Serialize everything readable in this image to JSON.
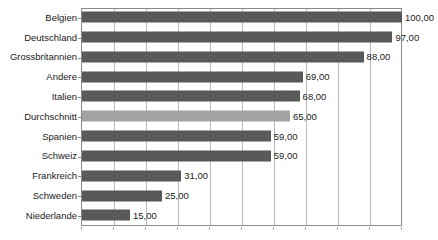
{
  "chart_data": {
    "type": "bar",
    "orientation": "horizontal",
    "title": "",
    "xlabel": "",
    "ylabel": "",
    "xlim": [
      0,
      100
    ],
    "grid": true,
    "gridline_step": 10,
    "legend": "none",
    "decimal_separator": ",",
    "categories": [
      "Belgien",
      "Deutschland",
      "Grossbritannien",
      "Andere",
      "Italien",
      "Durchschnitt",
      "Spanien",
      "Schweiz",
      "Frankreich",
      "Schweden",
      "Niederlande"
    ],
    "values": [
      100,
      97,
      88,
      69,
      68,
      65,
      59,
      59,
      31,
      25,
      15
    ],
    "value_labels": [
      "100,00",
      "97,00",
      "88,00",
      "69,00",
      "68,00",
      "65,00",
      "59,00",
      "59,00",
      "31,00",
      "25,00",
      "15,00"
    ],
    "highlight_index": 5,
    "colors": {
      "bar": "#595959",
      "bar_highlight": "#a3a3a3",
      "gridline": "#b8b8b8",
      "frame": "#8a8a8a",
      "text": "#1a1a1a",
      "background": "#ffffff"
    }
  }
}
